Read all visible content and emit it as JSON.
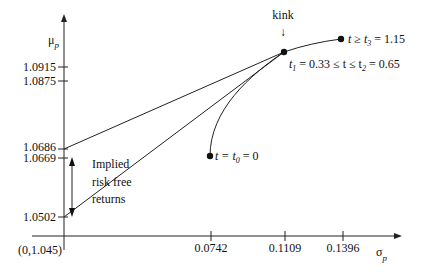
{
  "diagram": {
    "y_axis": {
      "label": "μ",
      "label_sub": "p",
      "ticks": [
        {
          "value": "1.0915",
          "y": 67
        },
        {
          "value": "1.0875",
          "y": 81
        },
        {
          "value": "1.0686",
          "y": 148
        },
        {
          "value": "1.0669",
          "y": 159
        },
        {
          "value": "1.0502",
          "y": 216
        }
      ]
    },
    "x_axis": {
      "label": "σ",
      "label_sub": "p",
      "origin_label": "(0,1.045)",
      "ticks": [
        {
          "value": "0.0742",
          "x": 211
        },
        {
          "value": "0.1109",
          "x": 285
        },
        {
          "value": "0.1396",
          "x": 343
        }
      ]
    },
    "annotations": {
      "kink": "kink",
      "kink_arrow": "↓",
      "t3_label": "t ≥ t",
      "t3_sub": "3",
      "t3_value": " = 1.15",
      "t12_label_a": "t",
      "t12_sub1": "1",
      "t12_mid": " = 0.33 ≤ t ≤ t",
      "t12_sub2": "2",
      "t12_value": " = 0.65",
      "t0_label": "t = t",
      "t0_sub": "0",
      "t0_value": " = 0",
      "implied_line1": "Implied",
      "implied_line2": "risk free",
      "implied_line3": "returns"
    },
    "points": {
      "t0": {
        "x": 210,
        "y": 156
      },
      "kink": {
        "x": 284,
        "y": 52
      },
      "t3": {
        "x": 341,
        "y": 39
      }
    }
  }
}
